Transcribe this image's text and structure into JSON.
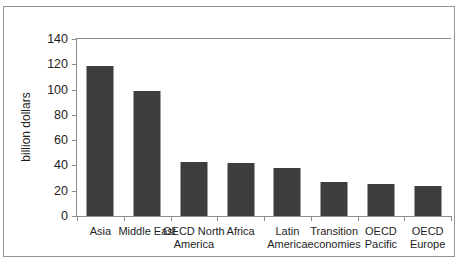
{
  "figure": {
    "clipped_caption": "",
    "frame_color": "#949494",
    "axis_color": "#8d8d8d",
    "bar_color": "#3d3d3d",
    "background": "#ffffff"
  },
  "chart_data": {
    "type": "bar",
    "title": "",
    "subtitle": "",
    "xlabel": "",
    "ylabel": "billion dollars",
    "categories": [
      "Asia",
      "Middle East",
      "OECD North America",
      "Africa",
      "Latin America",
      "Transition economies",
      "OECD Pacific",
      "OECD Europe"
    ],
    "values": [
      119,
      99,
      43,
      42,
      38,
      27,
      25,
      24
    ],
    "ylim": [
      0,
      140
    ],
    "yticks": [
      0,
      20,
      40,
      60,
      80,
      100,
      120,
      140
    ],
    "ytick_labels": [
      "0",
      "20",
      "40",
      "60",
      "80",
      "100",
      "120",
      "140"
    ],
    "grid": false,
    "legend": null,
    "series": [
      {
        "name": "billion dollars",
        "color": "#3d3d3d",
        "values": [
          119,
          99,
          43,
          42,
          38,
          27,
          25,
          24
        ]
      }
    ]
  }
}
